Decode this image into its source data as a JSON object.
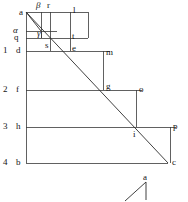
{
  "figure": {
    "stroke_color": "#3a3a3a",
    "diagonal_color": "#2b2b2b",
    "background": "#ffffff",
    "viewbox": {
      "width": 188,
      "height": 202
    },
    "main_diagonal": {
      "from": "a",
      "to": "c",
      "x1": 26,
      "y1": 12,
      "x2": 168,
      "y2": 163
    },
    "row_lines": [
      {
        "name": "row-top-a",
        "y": 12,
        "x_start": 26,
        "x_end": 88
      },
      {
        "name": "row-alpha",
        "y": 31,
        "x_start": 26,
        "x_end": 57
      },
      {
        "name": "row-q",
        "y": 38,
        "x_start": 26,
        "x_end": 88
      },
      {
        "name": "row-1-d",
        "y": 51,
        "x_start": 26,
        "x_end": 110
      },
      {
        "name": "row-2-f",
        "y": 90,
        "x_start": 26,
        "x_end": 142
      },
      {
        "name": "row-3-h",
        "y": 127,
        "x_start": 26,
        "x_end": 170
      },
      {
        "name": "row-4-b",
        "y": 163,
        "x_start": 26,
        "x_end": 168
      }
    ],
    "col_lines": [
      {
        "name": "col-left-axis",
        "x": 26,
        "y_start": 12,
        "y_end": 163
      },
      {
        "name": "col-beta",
        "x": 41,
        "y_start": 12,
        "y_end": 38
      },
      {
        "name": "col-r",
        "x": 50,
        "y_start": 12,
        "y_end": 38
      },
      {
        "name": "col-s",
        "x": 50,
        "y_start": 38,
        "y_end": 51
      },
      {
        "name": "col-l-t",
        "x": 70,
        "y_start": 12,
        "y_end": 38
      },
      {
        "name": "col-e",
        "x": 70,
        "y_start": 38,
        "y_end": 51
      },
      {
        "name": "col-gamma",
        "x": 41,
        "y_start": 31,
        "y_end": 38
      },
      {
        "name": "col-m",
        "x": 103,
        "y_start": 51,
        "y_end": 90
      },
      {
        "name": "col-o",
        "x": 136,
        "y_start": 90,
        "y_end": 127
      },
      {
        "name": "col-p",
        "x": 168,
        "y_start": 127,
        "y_end": 163
      }
    ],
    "points": [
      {
        "id": "a",
        "label": "a",
        "x": 19,
        "y": 8,
        "kind": "vertex"
      },
      {
        "id": "beta",
        "label": "β",
        "x": 36,
        "y": 1,
        "kind": "greek"
      },
      {
        "id": "r",
        "label": "r",
        "x": 47,
        "y": 1,
        "kind": "vertex"
      },
      {
        "id": "l",
        "label": "l",
        "x": 73,
        "y": 6,
        "kind": "vertex"
      },
      {
        "id": "alpha",
        "label": "α",
        "x": 13,
        "y": 26,
        "kind": "greek"
      },
      {
        "id": "gamma",
        "label": "γ",
        "x": 37,
        "y": 29,
        "kind": "greek"
      },
      {
        "id": "t",
        "label": "t",
        "x": 72,
        "y": 32,
        "kind": "vertex"
      },
      {
        "id": "q",
        "label": "q",
        "x": 14,
        "y": 33,
        "kind": "vertex"
      },
      {
        "id": "s",
        "label": "s",
        "x": 45,
        "y": 41,
        "kind": "vertex"
      },
      {
        "id": "e",
        "label": "e",
        "x": 72,
        "y": 44,
        "kind": "vertex"
      },
      {
        "id": "d",
        "label": "d",
        "x": 16,
        "y": 46,
        "kind": "vertex"
      },
      {
        "id": "m",
        "label": "m",
        "x": 106,
        "y": 48,
        "kind": "vertex"
      },
      {
        "id": "g",
        "label": "g",
        "x": 106,
        "y": 82,
        "kind": "vertex"
      },
      {
        "id": "f",
        "label": "f",
        "x": 16,
        "y": 85,
        "kind": "vertex"
      },
      {
        "id": "o",
        "label": "o",
        "x": 139,
        "y": 85,
        "kind": "vertex"
      },
      {
        "id": "h",
        "label": "h",
        "x": 16,
        "y": 122,
        "kind": "vertex"
      },
      {
        "id": "p",
        "label": "p",
        "x": 171,
        "y": 122,
        "kind": "vertex"
      },
      {
        "id": "i",
        "label": "i",
        "x": 133,
        "y": 130,
        "kind": "vertex"
      },
      {
        "id": "b",
        "label": "b",
        "x": 16,
        "y": 158,
        "kind": "vertex"
      },
      {
        "id": "c",
        "label": "c",
        "x": 171,
        "y": 158,
        "kind": "vertex"
      }
    ],
    "row_numbers": [
      {
        "label": "1",
        "x": 3,
        "y": 46
      },
      {
        "label": "2",
        "x": 3,
        "y": 85
      },
      {
        "label": "3",
        "x": 3,
        "y": 122
      },
      {
        "label": "4",
        "x": 3,
        "y": 158
      }
    ],
    "inset": {
      "name": "angle-inset",
      "label": "a",
      "label_x": 143,
      "label_y": 173,
      "apex_x": 146,
      "apex_y": 182,
      "foot_x": 146,
      "foot_y": 199,
      "ray_x": 126,
      "ray_y": 199
    }
  }
}
